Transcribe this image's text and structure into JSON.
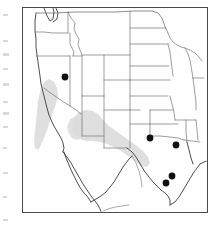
{
  "figure": {
    "type": "distribution-map",
    "region": "Western and central United States, northern Mexico",
    "background_color": "#fefefe",
    "frame": {
      "x": 22,
      "y": 7,
      "width": 185,
      "height": 205,
      "stroke_color": "#4a4a4a",
      "stroke_width": 1
    },
    "map": {
      "boundary_color": "#6b6b6b",
      "coastline_color": "#3c3c3c",
      "shading_color": "#dcdcdc",
      "shading_label": "shaded range area",
      "state_boundaries_visible": true
    },
    "points": {
      "marker_color": "#111111",
      "marker_shape": "filled-circle",
      "marker_radius": 3.4,
      "count": 5,
      "items": [
        {
          "id": "point-1",
          "x": 65,
          "y": 77,
          "area": "southern Idaho"
        },
        {
          "id": "point-2",
          "x": 150,
          "y": 138,
          "area": "southeastern New Mexico"
        },
        {
          "id": "point-3",
          "x": 176,
          "y": 145,
          "area": "north central Texas"
        },
        {
          "id": "point-4",
          "x": 172,
          "y": 176,
          "area": "south central Texas"
        },
        {
          "id": "point-5",
          "x": 166,
          "y": 183,
          "area": "southwestern Texas"
        }
      ]
    },
    "scan_marks": {
      "color": "#b9b9b9",
      "description": "faint scanning artifacts along left page margin",
      "items": [
        {
          "x": 3,
          "y": 14,
          "w": 5,
          "h": 2
        },
        {
          "x": 3,
          "y": 40,
          "w": 5,
          "h": 2
        },
        {
          "x": 3,
          "y": 53,
          "w": 6,
          "h": 3
        },
        {
          "x": 3,
          "y": 68,
          "w": 5,
          "h": 2
        },
        {
          "x": 3,
          "y": 83,
          "w": 6,
          "h": 3
        },
        {
          "x": 3,
          "y": 101,
          "w": 5,
          "h": 2
        },
        {
          "x": 3,
          "y": 112,
          "w": 6,
          "h": 3
        },
        {
          "x": 3,
          "y": 126,
          "w": 5,
          "h": 2
        },
        {
          "x": 3,
          "y": 147,
          "w": 4,
          "h": 2
        },
        {
          "x": 3,
          "y": 172,
          "w": 5,
          "h": 2
        },
        {
          "x": 3,
          "y": 196,
          "w": 4,
          "h": 2
        },
        {
          "x": 3,
          "y": 219,
          "w": 5,
          "h": 2
        }
      ]
    }
  }
}
